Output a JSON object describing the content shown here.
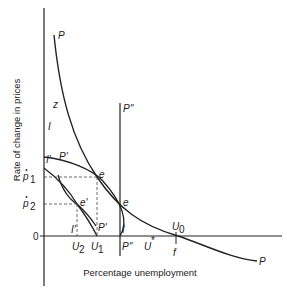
{
  "axes": {
    "y_title": "Rate of change in prices",
    "x_title": "Percentage unemployment",
    "origin_label": "0"
  },
  "y_ticks": {
    "p1": "p",
    "p1_sub": "1",
    "p2": "p",
    "p2_sub": "2"
  },
  "curve_labels": {
    "P_top": "P",
    "P_end": "P",
    "z": "z",
    "I_top": "I",
    "I_prime": "I'",
    "P_prime_top": "P'",
    "P_prime_bottom": "P'",
    "I_prime_bottom": "I'",
    "P_double_top": "P''",
    "P_double_bottom": "P''",
    "I_bottom": "I",
    "f": "f"
  },
  "points": {
    "e_upper": "e",
    "e_right": "e",
    "e_prime": "e'"
  },
  "x_ticks": {
    "U2": "U",
    "U2_sub": "2",
    "U1": "U",
    "U1_sub": "1",
    "U_star": "U",
    "U_star_sup": "*",
    "U0": "U",
    "U0_sub": "0"
  },
  "colors": {
    "line": "#222222",
    "dashed": "#444444"
  }
}
